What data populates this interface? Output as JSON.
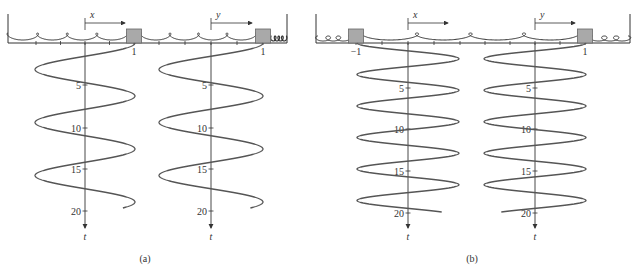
{
  "colors": {
    "line": "#333333",
    "curve": "#555555",
    "mass_fill": "#a9a9a9",
    "mass_stroke": "#666666"
  },
  "panels": [
    {
      "id": "a",
      "caption": "(a)",
      "frame": {
        "left": 8,
        "right": 287,
        "top": 14,
        "base": 43
      },
      "masses": [
        {
          "label": "1",
          "x": 134
        },
        {
          "label": "1",
          "x": 263
        }
      ],
      "displacements": [
        {
          "label": "x",
          "axis_x": 85,
          "arrow_to": 125
        },
        {
          "label": "y",
          "axis_x": 211,
          "arrow_to": 252
        }
      ],
      "t_axis": {
        "label": "t",
        "ticks": [
          {
            "label": "5",
            "y": 85
          },
          {
            "label": "10",
            "y": 128
          },
          {
            "label": "15",
            "y": 169
          },
          {
            "label": "20",
            "y": 211
          }
        ]
      },
      "curves": [
        {
          "center_x": 85,
          "amplitude": 50,
          "start_y": 43,
          "end_y": 208,
          "period": 53,
          "phase": 0,
          "end_partial": true
        },
        {
          "center_x": 211,
          "amplitude": 52,
          "start_y": 43,
          "end_y": 208,
          "period": 53,
          "phase": 0,
          "end_partial": true
        }
      ]
    },
    {
      "id": "b",
      "caption": "(b)",
      "frame": {
        "left": 316,
        "right": 630,
        "top": 14,
        "base": 43
      },
      "masses": [
        {
          "label": "−1",
          "x": 356
        },
        {
          "label": "1",
          "x": 585
        }
      ],
      "displacements": [
        {
          "label": "x",
          "axis_x": 408,
          "arrow_to": 448
        },
        {
          "label": "y",
          "axis_x": 535,
          "arrow_to": 575
        }
      ],
      "t_axis": {
        "label": "t",
        "ticks": [
          {
            "label": "5",
            "y": 88
          },
          {
            "label": "10",
            "y": 129
          },
          {
            "label": "15",
            "y": 171
          },
          {
            "label": "20",
            "y": 213
          }
        ]
      },
      "curves": [
        {
          "center_x": 408,
          "amplitude": 51,
          "start_y": 43,
          "end_y": 212,
          "period": 31.5,
          "phase": 180
        },
        {
          "center_x": 535,
          "amplitude": 51,
          "start_y": 43,
          "end_y": 212,
          "period": 31.5,
          "phase": 0
        }
      ]
    }
  ],
  "chart_data": {
    "type": "line",
    "panels": [
      {
        "caption": "(a)",
        "xlabel_left": "x",
        "xlabel_right": "y",
        "tlabel": "t",
        "t_ticks": [
          5,
          10,
          15,
          20
        ],
        "initial": {
          "x": 1,
          "y": 1
        },
        "series": [
          {
            "name": "x(t)",
            "amplitude": 1,
            "note": "in-phase oscillation, lower frequency"
          },
          {
            "name": "y(t)",
            "amplitude": 1,
            "note": "in-phase oscillation, lower frequency"
          }
        ]
      },
      {
        "caption": "(b)",
        "xlabel_left": "x",
        "xlabel_right": "y",
        "tlabel": "t",
        "t_ticks": [
          5,
          10,
          15,
          20
        ],
        "initial": {
          "x": -1,
          "y": 1
        },
        "series": [
          {
            "name": "x(t)",
            "amplitude": 1,
            "note": "anti-phase oscillation, higher frequency"
          },
          {
            "name": "y(t)",
            "amplitude": 1,
            "note": "anti-phase oscillation, higher frequency"
          }
        ]
      }
    ]
  }
}
